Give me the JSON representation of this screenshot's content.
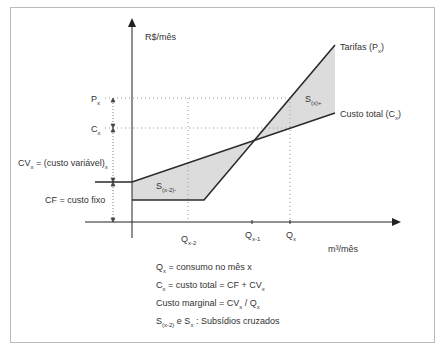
{
  "diagram": {
    "y_axis_label": "R$/mês",
    "x_axis_label": "m³/mês",
    "y_labels": {
      "px": "P",
      "px_sub": "x",
      "cx": "C",
      "cx_sub": "x",
      "cv": "CV",
      "cv_sub": "x",
      "cv_rest": " = (custo variável)",
      "cv_rest_sub": "x",
      "cf": "CF = custo fixo"
    },
    "x_labels": {
      "q_x2": "Q",
      "q_x2_sub": "x-2",
      "q_x1": "Q",
      "q_x1_sub": "x-1",
      "q_x": "Q",
      "q_x_sub": "x"
    },
    "line_labels": {
      "tarifas": "Tarifas (P",
      "tarifas_sub": "x",
      "tarifas_end": ")",
      "custo_total": "Custo total (C",
      "custo_total_sub": "x",
      "custo_total_end": ")"
    },
    "areas": {
      "s_x2": "S",
      "s_x2_sub": "(x-2)-",
      "s_x": "S",
      "s_x_sub": "(x)+"
    },
    "legend": [
      {
        "a": "Q",
        "a_sub": "x",
        "b": " = consumo no mês x"
      },
      {
        "a": "C",
        "a_sub": "x",
        "b": " = custo total = CF + CV",
        "b_sub": "x"
      },
      {
        "a": "Custo marginal = CV",
        "a_sub": "x",
        "b": " / Q",
        "b_sub": "x"
      },
      {
        "a": "S",
        "a_sub": "(x-2)",
        "b": "  e S",
        "b_sub": "x",
        "c": " : Subsídios cruzados"
      }
    ],
    "colors": {
      "line": "#2b2b2b",
      "fill": "#dcdcdc",
      "dotted": "#999999",
      "border": "#bbbbbb"
    }
  }
}
